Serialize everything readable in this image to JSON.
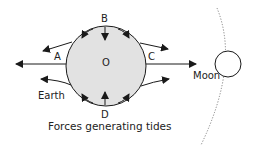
{
  "diagram": {
    "caption": "Forces generating tides",
    "labels": {
      "top": "B",
      "bottom": "D",
      "left": "A",
      "right": "C",
      "center": "O",
      "earth": "Earth",
      "moon": "Moon"
    },
    "colors": {
      "earth_fill": "#e2e2e2",
      "stroke": "#1a1a1a",
      "orbit": "#777777",
      "background": "#ffffff"
    }
  }
}
